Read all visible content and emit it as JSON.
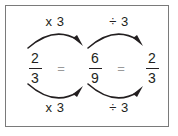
{
  "diagram": {
    "border_color": "#7a7a7a",
    "background_color": "#ffffff",
    "text_color": "#231f20",
    "equals_color": "#9a9a9a",
    "arrow_color": "#231f20",
    "labels": {
      "top_left": "x 3",
      "top_right": "÷ 3",
      "bottom_left": "x 3",
      "bottom_right": "÷ 3"
    },
    "fractions": [
      {
        "numerator": "2",
        "denominator": "3"
      },
      {
        "numerator": "6",
        "denominator": "9"
      },
      {
        "numerator": "2",
        "denominator": "3"
      }
    ],
    "operators": [
      "=",
      "="
    ]
  }
}
